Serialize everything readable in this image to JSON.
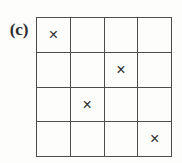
{
  "figure": {
    "panel_label": "(c)",
    "type": "grid-diagram"
  },
  "grid": {
    "rows": 4,
    "columns": 4,
    "mark_glyph": "×",
    "empty_glyph": "",
    "line_color": "#4d4d4d",
    "mark_color": "#2b2b2b",
    "background_color": "#fdfdfc",
    "marked_cells": [
      {
        "row": 1,
        "column": 1
      },
      {
        "row": 2,
        "column": 3
      },
      {
        "row": 3,
        "column": 2
      },
      {
        "row": 4,
        "column": 4
      }
    ],
    "cells": [
      [
        {
          "mark": "×",
          "marked": true
        },
        {
          "mark": "",
          "marked": false
        },
        {
          "mark": "",
          "marked": false
        },
        {
          "mark": "",
          "marked": false
        }
      ],
      [
        {
          "mark": "",
          "marked": false
        },
        {
          "mark": "",
          "marked": false
        },
        {
          "mark": "×",
          "marked": true
        },
        {
          "mark": "",
          "marked": false
        }
      ],
      [
        {
          "mark": "",
          "marked": false
        },
        {
          "mark": "×",
          "marked": true
        },
        {
          "mark": "",
          "marked": false
        },
        {
          "mark": "",
          "marked": false
        }
      ],
      [
        {
          "mark": "",
          "marked": false
        },
        {
          "mark": "",
          "marked": false
        },
        {
          "mark": "",
          "marked": false
        },
        {
          "mark": "×",
          "marked": true
        }
      ]
    ]
  }
}
